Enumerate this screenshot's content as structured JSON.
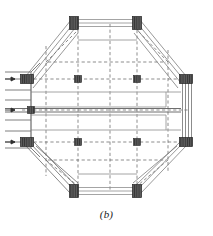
{
  "figure": {
    "caption": "(b)",
    "kind": "octagonal-frame-diagram",
    "colors": {
      "joint_block": "#575757",
      "joint_block_edge": "#2b2b2b",
      "solid_line": "#8a8a8a",
      "dark_line": "#4a4a4a",
      "dashed_line": "#5a5a5a",
      "background": "#ffffff"
    },
    "octagon_vertices": [
      {
        "name": "top-left",
        "x": 74,
        "y": 22
      },
      {
        "name": "top-right",
        "x": 137,
        "y": 22
      },
      {
        "name": "right-top",
        "x": 185,
        "y": 79
      },
      {
        "name": "right-bottom",
        "x": 185,
        "y": 142
      },
      {
        "name": "bottom-right",
        "x": 137,
        "y": 192
      },
      {
        "name": "bottom-left",
        "x": 74,
        "y": 192
      },
      {
        "name": "left-bottom",
        "x": 27,
        "y": 142
      },
      {
        "name": "left-top",
        "x": 27,
        "y": 79
      }
    ],
    "corner_joint_blocks": [
      {
        "name": "joint-top-left",
        "x": 70,
        "y": 17,
        "w": 9,
        "h": 12
      },
      {
        "name": "joint-top-right",
        "x": 133,
        "y": 17,
        "w": 9,
        "h": 12
      },
      {
        "name": "joint-right-top",
        "x": 180,
        "y": 74,
        "w": 12,
        "h": 9
      },
      {
        "name": "joint-right-bottom",
        "x": 180,
        "y": 137,
        "w": 12,
        "h": 9
      },
      {
        "name": "joint-bottom-right",
        "x": 133,
        "y": 185,
        "w": 9,
        "h": 12
      },
      {
        "name": "joint-bottom-left",
        "x": 70,
        "y": 185,
        "w": 9,
        "h": 12
      },
      {
        "name": "joint-left-bottom",
        "x": 21,
        "y": 137,
        "w": 12,
        "h": 9
      },
      {
        "name": "joint-left-top",
        "x": 21,
        "y": 74,
        "w": 12,
        "h": 9
      }
    ],
    "interior_nodes": [
      {
        "name": "node-grid-top-left",
        "x": 78,
        "y": 79
      },
      {
        "name": "node-grid-top-right",
        "x": 137,
        "y": 79
      },
      {
        "name": "node-grid-bottom-left",
        "x": 78,
        "y": 142
      },
      {
        "name": "node-grid-bottom-right",
        "x": 137,
        "y": 142
      },
      {
        "name": "node-mid-left",
        "x": 31,
        "y": 110
      }
    ],
    "dashed_grid": {
      "vertical_x": [
        46,
        78,
        110,
        137,
        168
      ],
      "horizontal_y": [
        62,
        79,
        110,
        142,
        160
      ],
      "x_min": 30,
      "x_max": 184,
      "y_min": 30,
      "y_max": 184
    },
    "load_arrows": [
      {
        "name": "load-arrow-top",
        "x": 10,
        "y": 79
      },
      {
        "name": "load-arrow-middle",
        "x": 10,
        "y": 110
      },
      {
        "name": "load-arrow-bottom",
        "x": 10,
        "y": 142
      }
    ],
    "left_protrusion": {
      "name": "left-support-protrusion",
      "x": 5,
      "y": 72,
      "w": 26,
      "h": 78
    },
    "chord_line_count_per_edge": 4,
    "diagonal_line_count_per_corner": 4
  }
}
